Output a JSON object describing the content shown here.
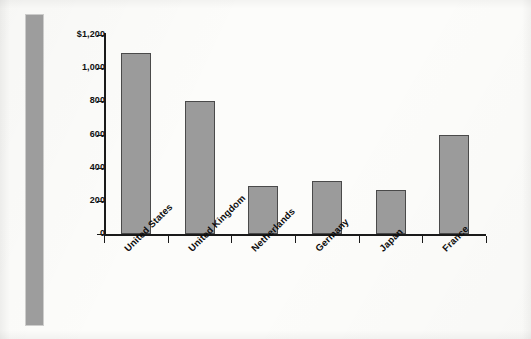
{
  "chart_data": {
    "type": "bar",
    "title": "",
    "subtitle": "",
    "xlabel": "",
    "ylabel": "",
    "categories": [
      "United States",
      "United Kingdom",
      "Netherlands",
      "Germany",
      "Japan",
      "France"
    ],
    "values": [
      1090,
      805,
      290,
      320,
      265,
      597
    ],
    "series": [
      {
        "name": "",
        "values": [
          1090,
          805,
          290,
          320,
          265,
          597
        ]
      }
    ],
    "ylim": [
      0,
      1200
    ],
    "ytick_values": [
      1200,
      1000,
      800,
      600,
      400,
      200,
      0
    ],
    "ytick_labels": [
      "$1,200",
      "1,000",
      "800",
      "600",
      "400",
      "200",
      "0"
    ],
    "grid": false,
    "legend": false,
    "legend_position": "none",
    "annotations": [],
    "bar_color": "#9b9b9b",
    "bar_edge_color": "#4a4a4a",
    "axis_color": "#1a1a1a",
    "background_color": "#fcfcfa",
    "accent_band_color": "#9d9d9d",
    "xtick_label_rotation": "-45"
  },
  "decoration": {
    "side_band_name": "left-accent-band"
  }
}
